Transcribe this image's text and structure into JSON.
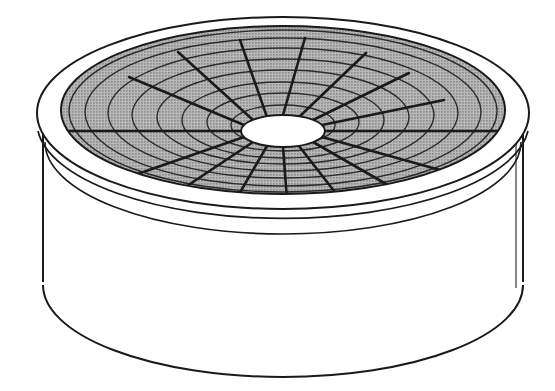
{
  "figure": {
    "style": "patent-line-drawing",
    "canvas": {
      "width": 555,
      "height": 391,
      "background": "#ffffff"
    },
    "colors": {
      "background": "#ffffff",
      "outline": "#1a1a1a",
      "body_fill": "#ffffff",
      "disc_fill": "#a9a9a9",
      "disc_halftone_dot": "#6e6e6e",
      "hub_fill": "#ffffff",
      "rim_fill": "#ffffff",
      "spoke_stroke": "#1a1a1a",
      "ring_stroke": "#2b2b2b"
    },
    "strokes": {
      "outline_width": 2.0,
      "rim_width": 1.8,
      "spoke_width": 2.6,
      "ring_width": 1.4,
      "hub_width": 2.0
    }
  },
  "geometry": {
    "view": "three-quarter isometric, viewed from above",
    "cylinder": {
      "center_x": 283,
      "top_ellipse_center_y": 113,
      "top_rx": 246,
      "top_ry": 96,
      "bottom_ellipse_center_y": 283,
      "bottom_rx": 222,
      "bottom_ry": 86,
      "wall_height": 170
    },
    "rim": {
      "outer_rx": 246,
      "outer_ry": 96,
      "outer_cy": 113,
      "lip_rx": 238,
      "lip_ry": 92,
      "lip_cy": 124,
      "inner_band_rx": 232,
      "inner_band_ry": 90,
      "inner_band_cy": 132,
      "band_count": 3
    },
    "disc": {
      "center_x": 283,
      "center_y": 110,
      "rx": 222,
      "ry": 84,
      "fill": "#a9a9a9"
    },
    "hub": {
      "center_x": 283,
      "center_y": 131,
      "rx": 42,
      "ry": 16,
      "fill": "#ffffff"
    },
    "rings": {
      "count": 8,
      "radii_fraction": [
        0.22,
        0.33,
        0.44,
        0.55,
        0.66,
        0.77,
        0.88,
        0.96
      ]
    },
    "spokes": {
      "count": 16,
      "angle_step_degrees": 22.5,
      "inner_radius_fraction": 0.18,
      "outer_radius_fraction": 0.97
    }
  },
  "labels": {
    "figure_caption": "",
    "annotations": []
  }
}
